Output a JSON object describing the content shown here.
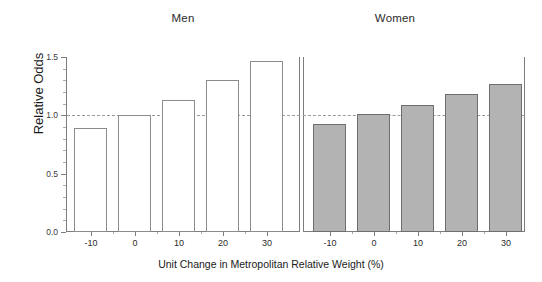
{
  "chart_data": {
    "type": "bar",
    "title": "",
    "xlabel": "Unit Change in Metropolitan Relative Weight (%)",
    "ylabel": "Relative Odds",
    "categories": [
      "-10",
      "0",
      "10",
      "20",
      "30"
    ],
    "ylim": [
      0.0,
      1.5
    ],
    "yticks": [
      "0.0",
      "0.5",
      "1.0",
      "1.5"
    ],
    "ytick_values": [
      0.0,
      0.5,
      1.0,
      1.5
    ],
    "grid": false,
    "legend": "none",
    "reference_line": {
      "value": 1.0,
      "style": "dashed",
      "color": "#9a9a9a"
    },
    "panels": [
      {
        "label": "Men",
        "bar_style": "open",
        "fill_color": "#ffffff",
        "edge_color": "#8c8c8c",
        "values": [
          0.89,
          1.0,
          1.13,
          1.3,
          1.47
        ]
      },
      {
        "label": "Women",
        "bar_style": "filled",
        "fill_color": "#b3b3b3",
        "edge_color": "#6e6e6e",
        "values": [
          0.93,
          1.01,
          1.09,
          1.18,
          1.27
        ]
      }
    ],
    "series": [
      {
        "name": "Men",
        "values": [
          0.89,
          1.0,
          1.13,
          1.3,
          1.47
        ]
      },
      {
        "name": "Women",
        "values": [
          0.93,
          1.01,
          1.09,
          1.18,
          1.27
        ]
      }
    ]
  },
  "axis": {
    "y_label": "Relative Odds",
    "x_label": "Unit Change in Metropolitan Relative Weight (%)",
    "y_ticks": [
      "1.5",
      "1.0",
      "0.5",
      "0.0"
    ],
    "x_ticks": [
      "-10",
      "0",
      "10",
      "20",
      "30"
    ]
  },
  "panels": {
    "men": {
      "title": "Men"
    },
    "women": {
      "title": "Women"
    }
  }
}
